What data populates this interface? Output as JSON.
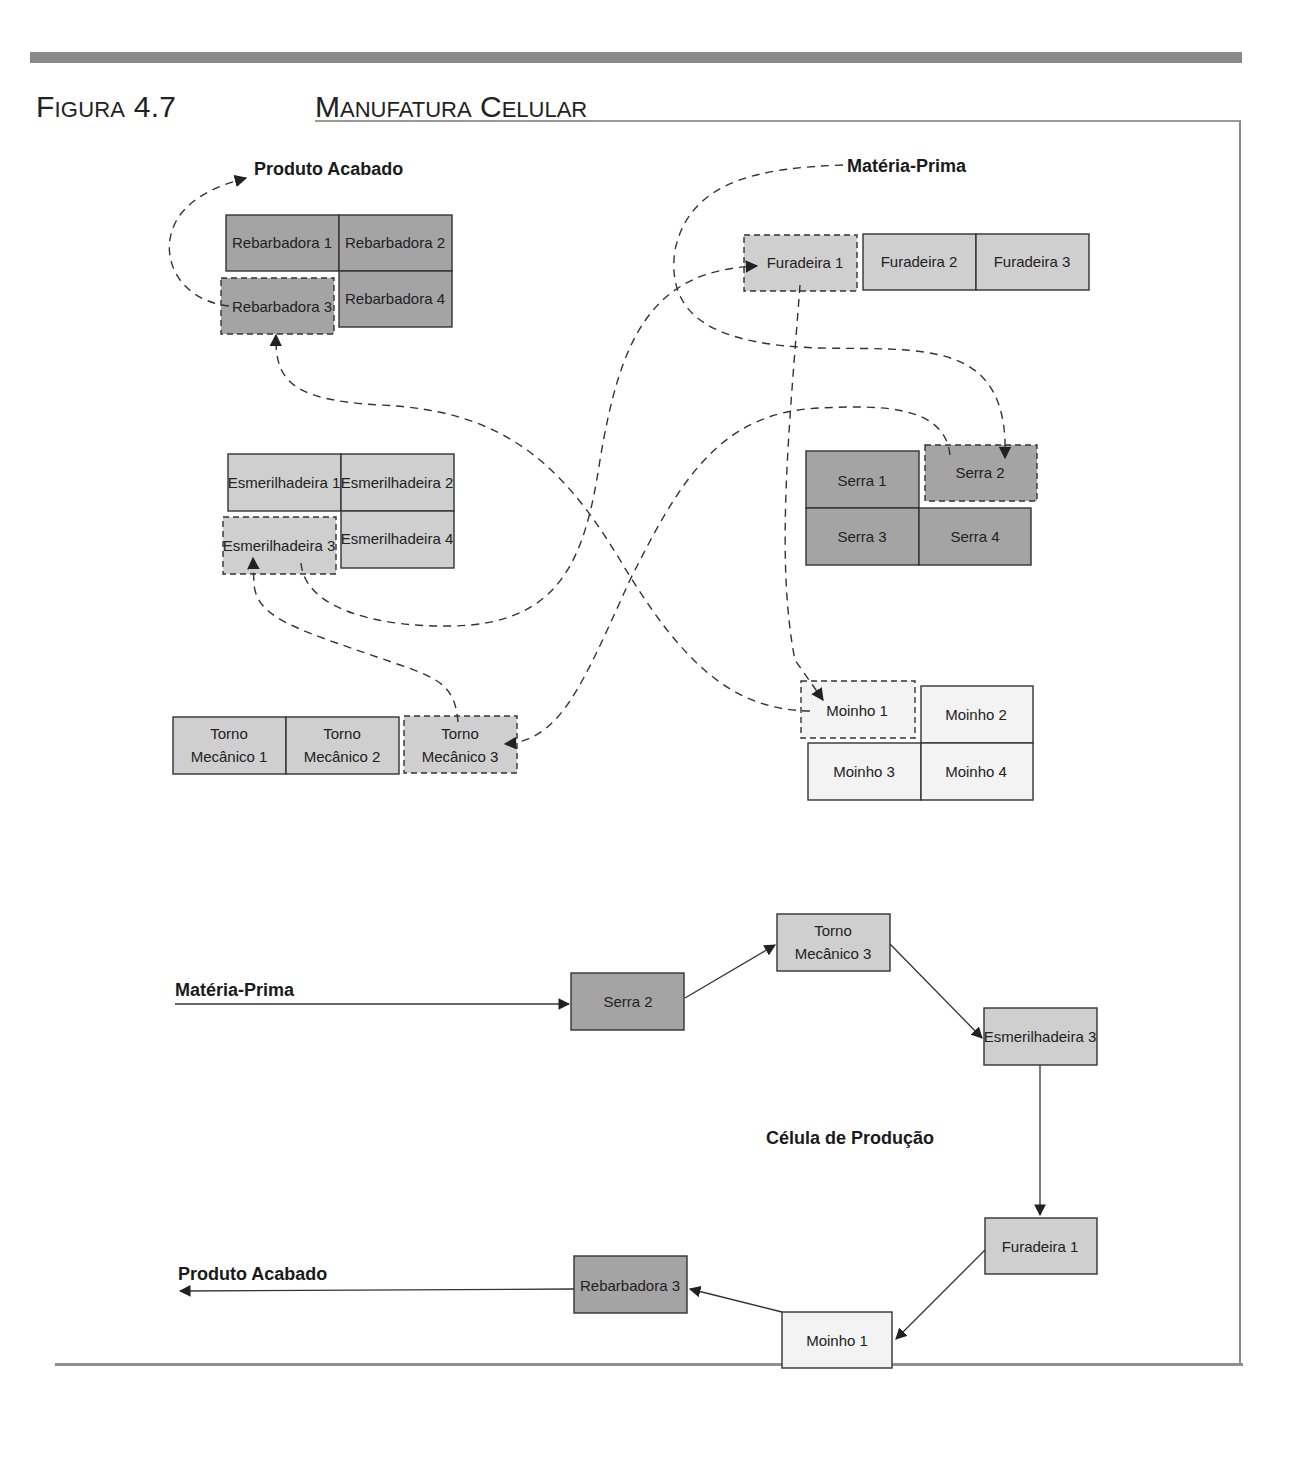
{
  "header": {
    "figure_number_first": "F",
    "figure_number_rest": "IGURA",
    "figure_number_value": "4.7",
    "title_m": "M",
    "title_anufatura": "ANUFATURA",
    "title_c": "C",
    "title_elular": "ELULAR"
  },
  "layout_plan": {
    "labels": {
      "finished_product": "Produto Acabado",
      "raw_material": "Matéria-Prima"
    },
    "groups": {
      "rebarbadoras": [
        "Rebarbadora 1",
        "Rebarbadora 2",
        "Rebarbadora 3",
        "Rebarbadora 4"
      ],
      "furadeiras": [
        "Furadeira 1",
        "Furadeira 2",
        "Furadeira 3"
      ],
      "esmerilhadeiras": [
        "Esmerilhadeira 1",
        "Esmerilhadeira 2",
        "Esmerilhadeira 3",
        "Esmerilhadeira 4"
      ],
      "serras": [
        "Serra 1",
        "Serra 2",
        "Serra 3",
        "Serra 4"
      ],
      "tornos": [
        {
          "line1": "Torno",
          "line2": "Mecânico 1"
        },
        {
          "line1": "Torno",
          "line2": "Mecânico 2"
        },
        {
          "line1": "Torno",
          "line2": "Mecânico 3"
        }
      ],
      "moinhos": [
        "Moinho 1",
        "Moinho 2",
        "Moinho 3",
        "Moinho 4"
      ]
    },
    "route": [
      "Matéria-Prima",
      "Serra 2",
      "Torno Mecânico 3",
      "Esmerilhadeira 3",
      "Furadeira 1",
      "Moinho 1",
      "Rebarbadora 3",
      "Produto Acabado"
    ]
  },
  "cell": {
    "title": "Célula de Produção",
    "input_label": "Matéria-Prima",
    "output_label": "Produto Acabado",
    "steps": {
      "serra": "Serra 2",
      "torno_line1": "Torno",
      "torno_line2": "Mecânico 3",
      "esmerilhadeira": "Esmerilhadeira 3",
      "furadeira": "Furadeira 1",
      "moinho": "Moinho 1",
      "rebarbadora": "Rebarbadora 3"
    }
  },
  "colors": {
    "dark_machine": "#a4a4a4",
    "mid_machine": "#cfcfcf",
    "light_machine": "#f3f3f3",
    "rule": "#8a8a8a"
  }
}
